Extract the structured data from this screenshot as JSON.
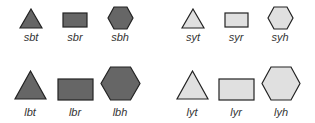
{
  "colors": {
    "dark_fill": "#666666",
    "light_fill": "#e0e0e0",
    "stroke": "#222222"
  },
  "shapes": [
    {
      "id": "sbt",
      "label": "sbt",
      "size": "small",
      "fill": "dark",
      "kind": "triangle"
    },
    {
      "id": "sbr",
      "label": "sbr",
      "size": "small",
      "fill": "dark",
      "kind": "rectangle"
    },
    {
      "id": "sbh",
      "label": "sbh",
      "size": "small",
      "fill": "dark",
      "kind": "hexagon"
    },
    {
      "id": "syt",
      "label": "syt",
      "size": "small",
      "fill": "light",
      "kind": "triangle"
    },
    {
      "id": "syr",
      "label": "syr",
      "size": "small",
      "fill": "light",
      "kind": "rectangle"
    },
    {
      "id": "syh",
      "label": "syh",
      "size": "small",
      "fill": "light",
      "kind": "hexagon"
    },
    {
      "id": "lbt",
      "label": "lbt",
      "size": "large",
      "fill": "dark",
      "kind": "triangle"
    },
    {
      "id": "lbr",
      "label": "lbr",
      "size": "large",
      "fill": "dark",
      "kind": "rectangle"
    },
    {
      "id": "lbh",
      "label": "lbh",
      "size": "large",
      "fill": "dark",
      "kind": "hexagon"
    },
    {
      "id": "lyt",
      "label": "lyt",
      "size": "large",
      "fill": "light",
      "kind": "triangle"
    },
    {
      "id": "lyr",
      "label": "lyr",
      "size": "large",
      "fill": "light",
      "kind": "rectangle"
    },
    {
      "id": "lyh",
      "label": "lyh",
      "size": "large",
      "fill": "light",
      "kind": "hexagon"
    }
  ]
}
